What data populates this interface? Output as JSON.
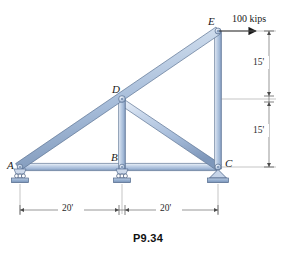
{
  "figure": {
    "caption": "P9.34",
    "background_color": "#ffffff",
    "member_color_light": "#dde6f2",
    "member_color_mid": "#aabdd8",
    "member_color_dark": "#7e97ba",
    "outline_color": "#5d7494",
    "dimension_color": "#3a3a3a"
  },
  "joints": [
    {
      "id": "A",
      "label": "A",
      "x": 18,
      "y": 167,
      "support": "roller"
    },
    {
      "id": "B",
      "label": "B",
      "x": 122,
      "y": 167,
      "support": "roller"
    },
    {
      "id": "C",
      "label": "C",
      "x": 218,
      "y": 167,
      "support": "pin"
    },
    {
      "id": "D",
      "label": "D",
      "x": 122,
      "y": 99,
      "support": "none"
    },
    {
      "id": "E",
      "label": "E",
      "x": 218,
      "y": 31,
      "support": "none"
    }
  ],
  "members": [
    {
      "from": "A",
      "to": "E",
      "kind": "top-chord-diagonal"
    },
    {
      "from": "A",
      "to": "C",
      "kind": "bottom-chord"
    },
    {
      "from": "D",
      "to": "B",
      "kind": "vertical"
    },
    {
      "from": "D",
      "to": "C",
      "kind": "diagonal"
    },
    {
      "from": "E",
      "to": "C",
      "kind": "vertical"
    }
  ],
  "load": {
    "label": "100 kips",
    "magnitude": 100,
    "units": "kips",
    "applied_at": "E",
    "direction": "horizontal-right"
  },
  "dimensions": {
    "vertical": [
      {
        "label": "15'",
        "value": 15,
        "units": "ft",
        "from": "E",
        "to": "D-level"
      },
      {
        "label": "15'",
        "value": 15,
        "units": "ft",
        "from": "D-level",
        "to": "C"
      }
    ],
    "horizontal": [
      {
        "label": "20'",
        "value": 20,
        "units": "ft",
        "from": "A",
        "to": "B"
      },
      {
        "label": "20'",
        "value": 20,
        "units": "ft",
        "from": "B",
        "to": "C"
      }
    ]
  },
  "labels": {
    "A": "A",
    "B": "B",
    "C": "C",
    "D": "D",
    "E": "E"
  }
}
